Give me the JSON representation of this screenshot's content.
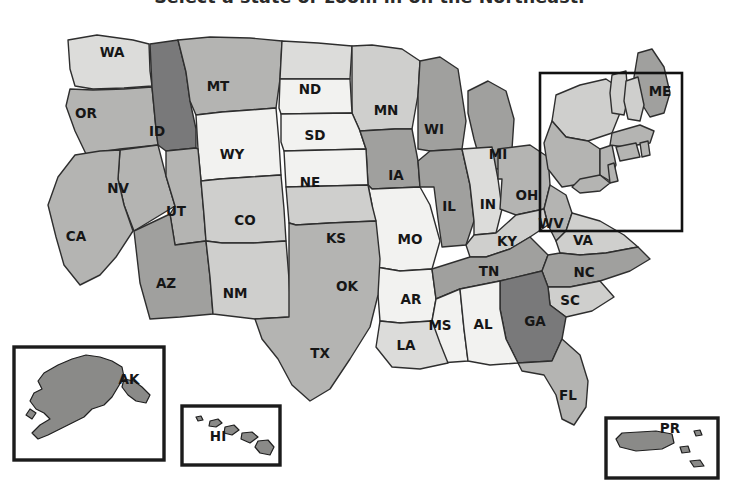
{
  "header": {
    "instruction": "Select a state or zoom in on the Northeast."
  },
  "map": {
    "name": "united-states-choropleth",
    "background": "#ffffff",
    "border_color": "#2e2e2e",
    "palette": {
      "very_light": "#f2f2f0",
      "light": "#dcdcda",
      "light_medium": "#cfcfcd",
      "medium": "#b4b4b2",
      "medium_dark": "#a0a09e",
      "dark": "#8a8a88",
      "darker": "#79797a"
    },
    "zoom_region": {
      "label": "Northeast",
      "x": 540,
      "y": 64,
      "width": 142,
      "height": 158,
      "stroke": "#111111"
    },
    "states": [
      {
        "code": "WA",
        "label_x": 112,
        "label_y": 44,
        "shade": "light"
      },
      {
        "code": "OR",
        "label_x": 86,
        "label_y": 105,
        "shade": "medium"
      },
      {
        "code": "ID",
        "label_x": 157,
        "label_y": 123,
        "shade": "darker"
      },
      {
        "code": "MT",
        "label_x": 218,
        "label_y": 78,
        "shade": "medium"
      },
      {
        "code": "ND",
        "label_x": 310,
        "label_y": 81,
        "shade": "light"
      },
      {
        "code": "MN",
        "label_x": 386,
        "label_y": 102,
        "shade": "light_medium"
      },
      {
        "code": "WI",
        "label_x": 434,
        "label_y": 121,
        "shade": "medium_dark"
      },
      {
        "code": "MI",
        "label_x": 498,
        "label_y": 146,
        "shade": "medium_dark"
      },
      {
        "code": "SD",
        "label_x": 315,
        "label_y": 127,
        "shade": "very_light"
      },
      {
        "code": "WY",
        "label_x": 232,
        "label_y": 146,
        "shade": "very_light"
      },
      {
        "code": "NV",
        "label_x": 118,
        "label_y": 180,
        "shade": "medium"
      },
      {
        "code": "UT",
        "label_x": 176,
        "label_y": 203,
        "shade": "medium"
      },
      {
        "code": "CO",
        "label_x": 245,
        "label_y": 212,
        "shade": "light_medium"
      },
      {
        "code": "NE",
        "label_x": 310,
        "label_y": 174,
        "shade": "very_light"
      },
      {
        "code": "IA",
        "label_x": 396,
        "label_y": 167,
        "shade": "medium_dark"
      },
      {
        "code": "IL",
        "label_x": 449,
        "label_y": 198,
        "shade": "medium_dark"
      },
      {
        "code": "IN",
        "label_x": 488,
        "label_y": 196,
        "shade": "light"
      },
      {
        "code": "OH",
        "label_x": 527,
        "label_y": 187,
        "shade": "medium"
      },
      {
        "code": "WV",
        "label_x": 551,
        "label_y": 215,
        "shade": "medium"
      },
      {
        "code": "VA",
        "label_x": 583,
        "label_y": 232,
        "shade": "light_medium"
      },
      {
        "code": "KY",
        "label_x": 507,
        "label_y": 233,
        "shade": "light_medium"
      },
      {
        "code": "CA",
        "label_x": 76,
        "label_y": 228,
        "shade": "medium"
      },
      {
        "code": "AZ",
        "label_x": 166,
        "label_y": 275,
        "shade": "medium_dark"
      },
      {
        "code": "NM",
        "label_x": 235,
        "label_y": 285,
        "shade": "light_medium"
      },
      {
        "code": "KS",
        "label_x": 336,
        "label_y": 230,
        "shade": "very_light"
      },
      {
        "code": "MO",
        "label_x": 410,
        "label_y": 231,
        "shade": "very_light"
      },
      {
        "code": "OK",
        "label_x": 347,
        "label_y": 278,
        "shade": "light_medium"
      },
      {
        "code": "AR",
        "label_x": 411,
        "label_y": 291,
        "shade": "very_light"
      },
      {
        "code": "TN",
        "label_x": 489,
        "label_y": 263,
        "shade": "medium_dark"
      },
      {
        "code": "NC",
        "label_x": 584,
        "label_y": 264,
        "shade": "medium_dark"
      },
      {
        "code": "SC",
        "label_x": 570,
        "label_y": 292,
        "shade": "light_medium"
      },
      {
        "code": "GA",
        "label_x": 535,
        "label_y": 313,
        "shade": "darker"
      },
      {
        "code": "MS",
        "label_x": 440,
        "label_y": 317,
        "shade": "very_light"
      },
      {
        "code": "AL",
        "label_x": 483,
        "label_y": 316,
        "shade": "very_light"
      },
      {
        "code": "LA",
        "label_x": 406,
        "label_y": 337,
        "shade": "light"
      },
      {
        "code": "TX",
        "label_x": 320,
        "label_y": 345,
        "shade": "medium"
      },
      {
        "code": "FL",
        "label_x": 568,
        "label_y": 387,
        "shade": "medium"
      },
      {
        "code": "ME",
        "label_x": 660,
        "label_y": 83,
        "shade": "medium_dark"
      }
    ],
    "insets": [
      {
        "code": "AK",
        "name": "alaska-inset",
        "label_x": 129,
        "label_y": 371,
        "box_x": 14,
        "box_y": 338,
        "box_w": 150,
        "box_h": 113,
        "shade": "dark"
      },
      {
        "code": "HI",
        "name": "hawaii-inset",
        "label_x": 218,
        "label_y": 428,
        "box_x": 182,
        "box_y": 397,
        "box_w": 98,
        "box_h": 59,
        "shade": "dark"
      },
      {
        "code": "PR",
        "name": "puerto-rico-inset",
        "label_x": 670,
        "label_y": 420,
        "box_x": 606,
        "box_y": 409,
        "box_w": 112,
        "box_h": 60,
        "shade": "dark"
      }
    ]
  }
}
